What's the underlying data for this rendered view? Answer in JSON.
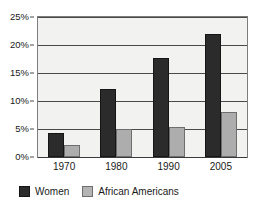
{
  "chart_data": {
    "type": "bar",
    "title": "",
    "subtitle": "",
    "xlabel": "",
    "ylabel": "",
    "categories": [
      "1970",
      "1980",
      "1990",
      "2005"
    ],
    "series": [
      {
        "name": "Women",
        "color": "#2b2b2b",
        "values": [
          4.3,
          12.2,
          17.6,
          22.0
        ]
      },
      {
        "name": "African Americans",
        "color": "#adadad",
        "values": [
          2.2,
          5.0,
          5.4,
          8.1
        ]
      }
    ],
    "ylim": [
      0,
      25
    ],
    "ytick_values": [
      0,
      5,
      10,
      15,
      20,
      25
    ],
    "ytick_labels": [
      "0%",
      "5%",
      "10%",
      "15%",
      "20%",
      "25%"
    ],
    "grid": true,
    "grid_axis": "y",
    "legend_position": "bottom-left",
    "plot_background": "#f2f2f0",
    "frame_color": "#7d7d7d",
    "gridline_color": "#4a4a4a"
  }
}
